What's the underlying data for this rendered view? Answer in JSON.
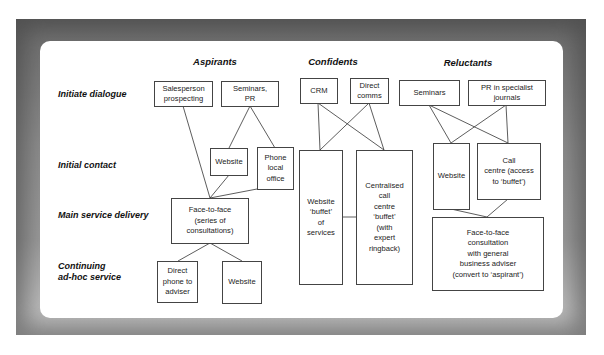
{
  "diagram": {
    "columns": {
      "aspirants": "Aspirants",
      "confidents": "Confidents",
      "reluctants": "Reluctants"
    },
    "rows": {
      "initiate_dialogue": "Initiate dialogue",
      "initial_contact": "Initial contact",
      "main_service_delivery": "Main service delivery",
      "continuing_line1": "Continuing",
      "continuing_line2": "ad-hoc service"
    },
    "aspirants": {
      "salesperson": "Salesperson\nprospecting",
      "seminars_pr": "Seminars,\nPR",
      "website": "Website",
      "phone_office": "Phone\nlocal\noffice",
      "face_to_face": "Face-to-face\n(series of\nconsultations)",
      "direct_phone": "Direct\nphone to\nadviser",
      "website_continuing": "Website"
    },
    "confidents": {
      "crm": "CRM",
      "direct_comms": "Direct\ncomms",
      "website_buffet": "Website\n‘buffet’\nof\nservices",
      "call_centre": "Centralised\ncall\ncentre\n‘buffet’\n(with\nexpert\nringback)"
    },
    "reluctants": {
      "seminars": "Seminars",
      "pr_journals": "PR in specialist\njournals",
      "website": "Website",
      "call_centre": "Call\ncentre (access\nto ‘buffet’)",
      "face_to_face": "Face-to-face\nconsultation\nwith general\nbusiness adviser\n(convert to ‘aspirant’)"
    }
  }
}
